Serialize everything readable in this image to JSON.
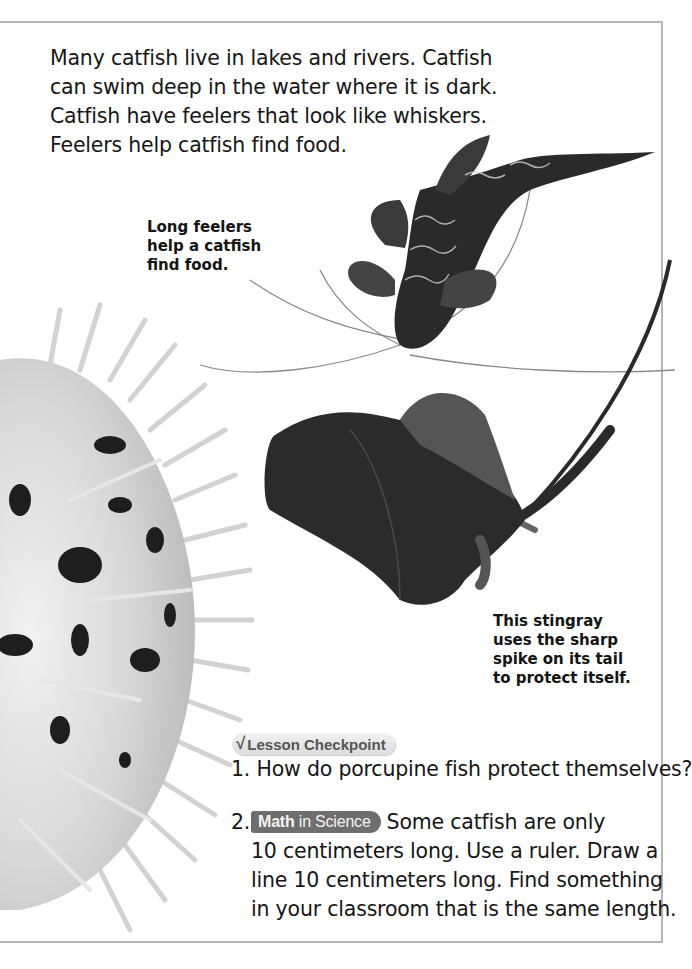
{
  "page": {
    "intro_lines": [
      "Many catfish live in lakes and rivers. Catfish",
      "can swim deep in the water where it is dark.",
      "Catfish have feelers that look like whiskers.",
      "Feelers help catfish find food."
    ],
    "captions": {
      "catfish": [
        "Long feelers",
        "help a catfish",
        "find food."
      ],
      "stingray": [
        "This stingray",
        "uses the sharp",
        "spike on its tail",
        "to protect itself."
      ]
    },
    "images": {
      "catfish": "catfish-photo",
      "porcupine_fish": "porcupine-fish-photo",
      "stingray": "stingray-photo"
    }
  },
  "checkpoint": {
    "icon": "checkmark-icon",
    "icon_glyph": "√",
    "title": "Lesson Checkpoint",
    "questions": [
      {
        "number": "1.",
        "lines": [
          "How do porcupine fish protect themselves?"
        ]
      },
      {
        "number": "2.",
        "badge_bold": "Math",
        "badge_rest": " in Science",
        "first_line_rest": "Some catfish are only",
        "lines": [
          "10 centimeters long. Use a ruler. Draw a",
          "line 10 centimeters long. Find something",
          "in your classroom that is the same length."
        ]
      }
    ]
  },
  "colors": {
    "frame": "#b5b5b5",
    "badge_math": "#6e6e6e",
    "badge_checkpoint": "#e4e4e4",
    "text": "#161616"
  }
}
